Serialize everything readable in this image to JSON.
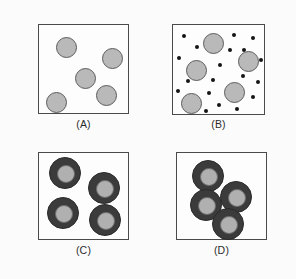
{
  "figure": {
    "title": "",
    "background_color": "#fbfbfb",
    "width": 296,
    "height": 279,
    "colors": {
      "panel_border": "#4a4a4a",
      "panel_fill": "#fdfdfd",
      "particle_fill": "#b9b9b9",
      "particle_stroke": "#5c5c5c",
      "corona_fill": "#3b3b3b",
      "core_fill": "#b0b0b0",
      "dot_fill": "#151515",
      "label_color": "#2b2b2b"
    }
  },
  "panels": [
    {
      "id": "A",
      "label": "(A)",
      "box": {
        "x": 38,
        "y": 24,
        "w": 91,
        "h": 90
      },
      "label_y": 118,
      "particle_type": "plain",
      "particles": [
        {
          "cx": 27,
          "cy": 22,
          "r": 10.5
        },
        {
          "cx": 73,
          "cy": 33,
          "r": 10.5
        },
        {
          "cx": 46,
          "cy": 53,
          "r": 10.5
        },
        {
          "cx": 67,
          "cy": 70,
          "r": 10.5
        },
        {
          "cx": 17,
          "cy": 77,
          "r": 10.5
        }
      ],
      "dots": []
    },
    {
      "id": "B",
      "label": "(B)",
      "box": {
        "x": 172,
        "y": 24,
        "w": 93,
        "h": 91
      },
      "label_y": 118,
      "particle_type": "plain",
      "particles": [
        {
          "cx": 40,
          "cy": 18,
          "r": 10.5
        },
        {
          "cx": 75,
          "cy": 36,
          "r": 10.5
        },
        {
          "cx": 23,
          "cy": 45,
          "r": 10.5
        },
        {
          "cx": 61,
          "cy": 67,
          "r": 10.5
        },
        {
          "cx": 18,
          "cy": 78,
          "r": 10.5
        }
      ],
      "dots": [
        {
          "cx": 11,
          "cy": 11,
          "r": 2.3
        },
        {
          "cx": 61,
          "cy": 10,
          "r": 2.3
        },
        {
          "cx": 80,
          "cy": 13,
          "r": 2.3
        },
        {
          "cx": 24,
          "cy": 22,
          "r": 2.3
        },
        {
          "cx": 57,
          "cy": 25,
          "r": 2.3
        },
        {
          "cx": 71,
          "cy": 25,
          "r": 2.3
        },
        {
          "cx": 6,
          "cy": 33,
          "r": 2.3
        },
        {
          "cx": 47,
          "cy": 40,
          "r": 2.3
        },
        {
          "cx": 88,
          "cy": 35,
          "r": 2.3
        },
        {
          "cx": 15,
          "cy": 56,
          "r": 2.3
        },
        {
          "cx": 40,
          "cy": 55,
          "r": 2.3
        },
        {
          "cx": 70,
          "cy": 51,
          "r": 2.3
        },
        {
          "cx": 85,
          "cy": 57,
          "r": 2.3
        },
        {
          "cx": 5,
          "cy": 66,
          "r": 2.3
        },
        {
          "cx": 36,
          "cy": 68,
          "r": 2.3
        },
        {
          "cx": 80,
          "cy": 72,
          "r": 2.3
        },
        {
          "cx": 46,
          "cy": 80,
          "r": 2.3
        },
        {
          "cx": 64,
          "cy": 84,
          "r": 2.3
        },
        {
          "cx": 33,
          "cy": 86,
          "r": 2.3
        }
      ]
    },
    {
      "id": "C",
      "label": "(C)",
      "box": {
        "x": 38,
        "y": 152,
        "w": 91,
        "h": 88
      },
      "label_y": 244,
      "particle_type": "ring",
      "particles": [
        {
          "cx": 26,
          "cy": 20,
          "r": 16,
          "core_r": 9
        },
        {
          "cx": 65,
          "cy": 35,
          "r": 16,
          "core_r": 9
        },
        {
          "cx": 24,
          "cy": 60,
          "r": 16,
          "core_r": 9
        },
        {
          "cx": 66,
          "cy": 67,
          "r": 16,
          "core_r": 9
        }
      ],
      "dots": []
    },
    {
      "id": "D",
      "label": "(D)",
      "box": {
        "x": 176,
        "y": 152,
        "w": 91,
        "h": 88
      },
      "label_y": 244,
      "particle_type": "ring",
      "particles": [
        {
          "cx": 31,
          "cy": 23,
          "r": 16,
          "core_r": 9
        },
        {
          "cx": 29,
          "cy": 52,
          "r": 16,
          "core_r": 9
        },
        {
          "cx": 59,
          "cy": 44,
          "r": 16,
          "core_r": 9
        },
        {
          "cx": 51,
          "cy": 71,
          "r": 16,
          "core_r": 9
        }
      ],
      "dots": []
    }
  ]
}
